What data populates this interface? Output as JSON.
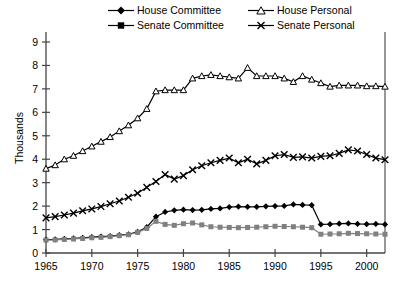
{
  "chart_data": {
    "type": "line",
    "title": "",
    "xlabel": "",
    "ylabel": "Thousands",
    "xlim": [
      1965,
      2002
    ],
    "ylim": [
      0,
      9
    ],
    "xticks": [
      1965,
      1970,
      1975,
      1980,
      1985,
      1990,
      1995,
      2000
    ],
    "yticks": [
      0,
      1,
      2,
      3,
      4,
      5,
      6,
      7,
      8,
      9
    ],
    "grid": false,
    "legend_position": "top",
    "x": [
      1965,
      1966,
      1967,
      1968,
      1969,
      1970,
      1971,
      1972,
      1973,
      1974,
      1975,
      1976,
      1977,
      1978,
      1979,
      1980,
      1981,
      1982,
      1983,
      1984,
      1985,
      1986,
      1987,
      1988,
      1989,
      1990,
      1991,
      1992,
      1993,
      1994,
      1995,
      1996,
      1997,
      1998,
      1999,
      2000,
      2001,
      2002
    ],
    "series": [
      {
        "name": "House Committee",
        "marker": "filled-diamond",
        "color": "#000000",
        "values": [
          0.57,
          0.58,
          0.6,
          0.62,
          0.65,
          0.68,
          0.7,
          0.72,
          0.76,
          0.8,
          0.9,
          1.1,
          1.55,
          1.75,
          1.82,
          1.85,
          1.83,
          1.84,
          1.88,
          1.9,
          1.96,
          1.98,
          1.97,
          1.97,
          1.99,
          2.0,
          2.01,
          2.07,
          2.05,
          2.04,
          1.22,
          1.23,
          1.25,
          1.26,
          1.24,
          1.23,
          1.24,
          1.22
        ]
      },
      {
        "name": "Senate Committee",
        "marker": "filled-square",
        "color": "#808080",
        "values": [
          0.55,
          0.56,
          0.58,
          0.6,
          0.62,
          0.65,
          0.67,
          0.7,
          0.74,
          0.78,
          0.88,
          1.05,
          1.35,
          1.22,
          1.18,
          1.25,
          1.28,
          1.2,
          1.12,
          1.1,
          1.09,
          1.08,
          1.09,
          1.1,
          1.12,
          1.14,
          1.13,
          1.12,
          1.1,
          1.08,
          0.8,
          0.81,
          0.82,
          0.84,
          0.83,
          0.82,
          0.81,
          0.8
        ]
      },
      {
        "name": "House Personal",
        "marker": "open-triangle",
        "color": "#000000",
        "values": [
          3.6,
          3.75,
          4.0,
          4.15,
          4.35,
          4.55,
          4.75,
          4.95,
          5.2,
          5.45,
          5.75,
          6.15,
          6.9,
          6.95,
          6.95,
          6.95,
          7.45,
          7.55,
          7.6,
          7.55,
          7.5,
          7.45,
          7.9,
          7.55,
          7.55,
          7.55,
          7.45,
          7.3,
          7.55,
          7.4,
          7.25,
          7.1,
          7.15,
          7.15,
          7.15,
          7.12,
          7.12,
          7.1
        ]
      },
      {
        "name": "Senate Personal",
        "marker": "x-cross",
        "color": "#000000",
        "values": [
          1.5,
          1.55,
          1.62,
          1.7,
          1.8,
          1.88,
          1.98,
          2.1,
          2.22,
          2.38,
          2.55,
          2.8,
          3.05,
          3.35,
          3.15,
          3.3,
          3.55,
          3.72,
          3.85,
          3.95,
          4.05,
          3.85,
          4.0,
          3.8,
          3.95,
          4.15,
          4.2,
          4.08,
          4.1,
          4.05,
          4.12,
          4.15,
          4.25,
          4.4,
          4.35,
          4.2,
          4.05,
          3.98
        ]
      }
    ]
  },
  "legend": {
    "entries": [
      {
        "label": "House Committee",
        "marker": "filled-diamond"
      },
      {
        "label": "House Personal",
        "marker": "open-triangle"
      },
      {
        "label": "Senate Committee",
        "marker": "filled-square"
      },
      {
        "label": "Senate Personal",
        "marker": "x-cross"
      }
    ]
  },
  "axes": {
    "ylabel": "Thousands"
  }
}
